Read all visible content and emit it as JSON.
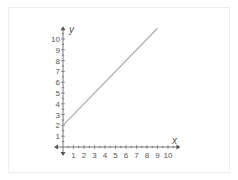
{
  "chart_data": {
    "type": "line",
    "title": "",
    "xlabel": "x",
    "ylabel": "y",
    "xlim": [
      0,
      10
    ],
    "ylim": [
      0,
      10
    ],
    "x_ticks": [
      "1",
      "2",
      "3",
      "4",
      "5",
      "6",
      "7",
      "8",
      "9",
      "10"
    ],
    "y_ticks": [
      "1",
      "2",
      "3",
      "4",
      "5",
      "6",
      "7",
      "8",
      "9",
      "10"
    ],
    "grid": false,
    "legend": null,
    "series": [
      {
        "name": "y = x + 2",
        "x": [
          0,
          9
        ],
        "y": [
          2,
          11
        ],
        "color": "#b0b0b0"
      }
    ]
  },
  "colors": {
    "axis": "#555555",
    "line": "#b0b0b0"
  }
}
